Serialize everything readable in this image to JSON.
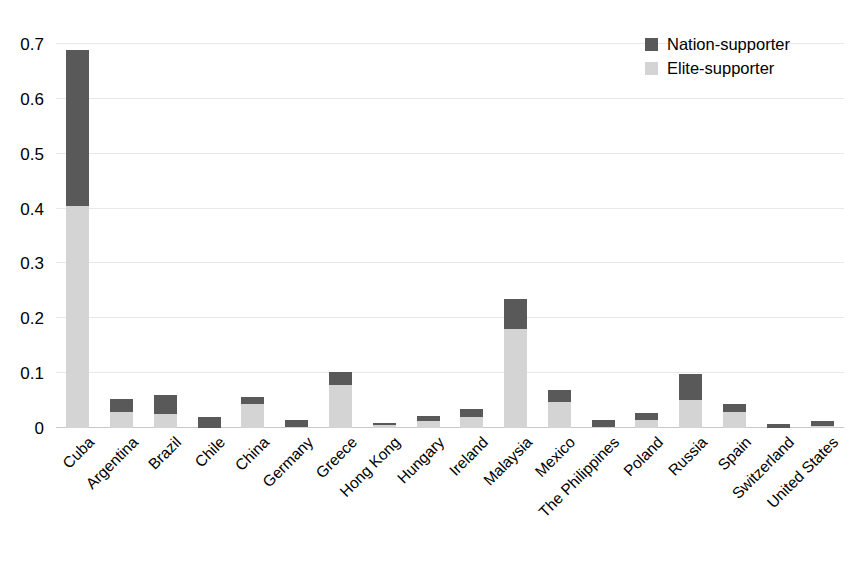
{
  "chart_data": {
    "type": "bar",
    "stacked": true,
    "title": "",
    "xlabel": "",
    "ylabel": "",
    "ylim": [
      0,
      0.7
    ],
    "ytick_values": [
      0,
      0.1,
      0.2,
      0.3,
      0.4,
      0.5,
      0.6,
      0.7
    ],
    "ytick_labels": [
      "0",
      "0.1",
      "0.2",
      "0.3",
      "0.4",
      "0.5",
      "0.6",
      "0.7"
    ],
    "grid": true,
    "legend_position": "top-right",
    "categories": [
      "Cuba",
      "Argentina",
      "Brazil",
      "Chile",
      "China",
      "Germany",
      "Greece",
      "Hong Kong",
      "Hungary",
      "Ireland",
      "Malaysia",
      "Mexico",
      "The Philippines",
      "Poland",
      "Russia",
      "Spain",
      "Switzerland",
      "United States"
    ],
    "series": [
      {
        "name": "Elite-supporter",
        "color": "#d4d4d4",
        "values": [
          0.405,
          0.03,
          0.026,
          0.0,
          0.044,
          0.002,
          0.078,
          0.006,
          0.013,
          0.02,
          0.18,
          0.047,
          0.002,
          0.015,
          0.051,
          0.029,
          0.0,
          0.003
        ]
      },
      {
        "name": "Nation-supporter",
        "color": "#595959",
        "values": [
          0.285,
          0.022,
          0.034,
          0.02,
          0.013,
          0.013,
          0.024,
          0.003,
          0.009,
          0.015,
          0.055,
          0.022,
          0.013,
          0.013,
          0.047,
          0.015,
          0.007,
          0.009
        ]
      }
    ],
    "totals": [
      0.69,
      0.052,
      0.06,
      0.02,
      0.057,
      0.015,
      0.102,
      0.009,
      0.022,
      0.035,
      0.235,
      0.069,
      0.015,
      0.028,
      0.098,
      0.044,
      0.007,
      0.012
    ]
  },
  "legend": {
    "items": [
      {
        "label": "Nation-supporter",
        "color": "#595959"
      },
      {
        "label": "Elite-supporter",
        "color": "#d4d4d4"
      }
    ]
  },
  "colors": {
    "nation_supporter": "#595959",
    "elite_supporter": "#d4d4d4",
    "gridline": "#e8e8e8",
    "baseline": "#c9c9c9",
    "background": "#ffffff"
  }
}
